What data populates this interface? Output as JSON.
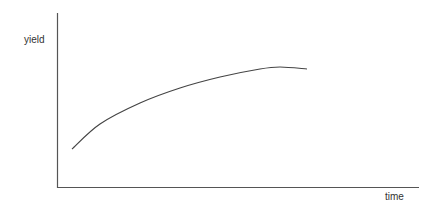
{
  "chart_data": {
    "type": "line",
    "title": "",
    "xlabel": "time",
    "ylabel": "yield",
    "grid": false,
    "ticks": false,
    "legend": null,
    "series": [
      {
        "name": "yield",
        "description": "concave increasing curve that rises quickly then levels off (slight decline at end)",
        "points_px": [
          [
            72,
            149
          ],
          [
            100,
            124
          ],
          [
            140,
            103
          ],
          [
            180,
            88
          ],
          [
            220,
            77
          ],
          [
            260,
            69
          ],
          [
            280,
            67
          ],
          [
            307,
            69
          ]
        ]
      }
    ],
    "axes": {
      "origin_px": [
        57,
        187
      ],
      "y_top_px": 13,
      "x_right_px": 419
    }
  },
  "colors": {
    "axis": "#555555",
    "curve": "#444444",
    "text": "#333333"
  }
}
